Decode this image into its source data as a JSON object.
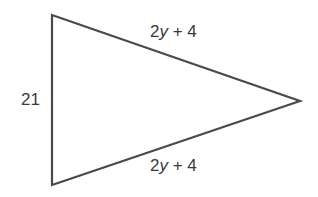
{
  "diagram": {
    "shape": "isosceles triangle",
    "stroke_color": "#4a4a4a",
    "vertices": [
      [
        52,
        15
      ],
      [
        52,
        185
      ],
      [
        300,
        101
      ]
    ],
    "labels": {
      "left_side": "21",
      "top_side": {
        "coef": "2",
        "var": "y",
        "rest": " + 4"
      },
      "bottom_side": {
        "coef": "2",
        "var": "y",
        "rest": " + 4"
      }
    }
  }
}
